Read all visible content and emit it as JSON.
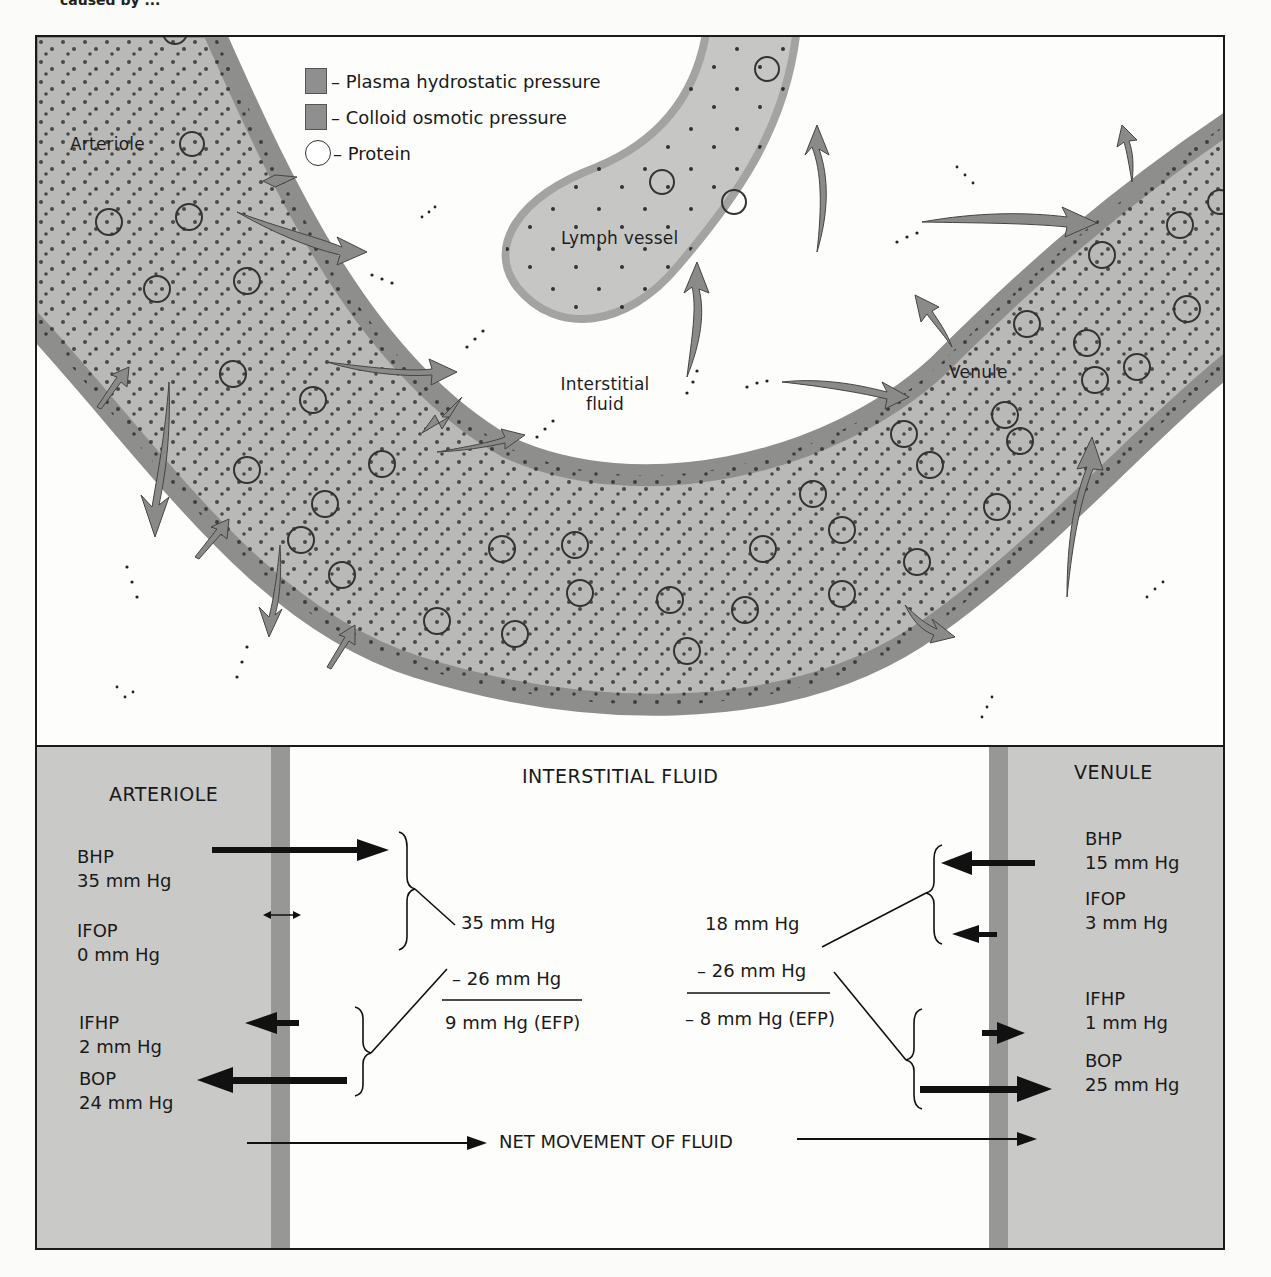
{
  "caption_fragment": "caused by ...",
  "diagram": {
    "labels": {
      "arteriole": "Arteriole",
      "lymph_vessel": "Lymph vessel",
      "interstitial_fluid_line1": "Interstitial",
      "interstitial_fluid_line2": "fluid",
      "venule": "Venule"
    },
    "legend": [
      {
        "icon": "square-swatch",
        "label": "– Plasma hydrostatic pressure"
      },
      {
        "icon": "square-swatch",
        "label": "– Colloid osmotic pressure"
      },
      {
        "icon": "circle-outline",
        "label": "– Protein"
      }
    ],
    "colors": {
      "vessel_fill": "#b9b9b7",
      "vessel_wall": "#8e8e8d",
      "lymph_fill": "#c6c6c4",
      "arrow_fill": "#8a8a89",
      "dot": "#222222",
      "border": "#1a1a1a"
    }
  },
  "panel": {
    "headers": {
      "arteriole": "ARTERIOLE",
      "interstitial": "INTERSTITIAL FLUID",
      "venule": "VENULE"
    },
    "arteriole_side": [
      {
        "name": "BHP",
        "value": "35 mm Hg",
        "direction": "out"
      },
      {
        "name": "IFOP",
        "value": "0 mm Hg",
        "direction": "none"
      },
      {
        "name": "IFHP",
        "value": "2 mm Hg",
        "direction": "in"
      },
      {
        "name": "BOP",
        "value": "24 mm Hg",
        "direction": "in"
      }
    ],
    "venule_side": [
      {
        "name": "BHP",
        "value": "15 mm Hg",
        "direction": "out"
      },
      {
        "name": "IFOP",
        "value": "3 mm Hg",
        "direction": "out"
      },
      {
        "name": "IFHP",
        "value": "1 mm Hg",
        "direction": "in"
      },
      {
        "name": "BOP",
        "value": "25 mm Hg",
        "direction": "in"
      }
    ],
    "arteriole_calc": {
      "outward_sum": "35 mm Hg",
      "inward_sum": "– 26 mm Hg",
      "result": "9 mm Hg (EFP)"
    },
    "venule_calc": {
      "outward_sum": "18 mm Hg",
      "inward_sum": "– 26 mm Hg",
      "result": "– 8 mm Hg (EFP)"
    },
    "net_movement_label": "NET MOVEMENT OF FLUID"
  }
}
